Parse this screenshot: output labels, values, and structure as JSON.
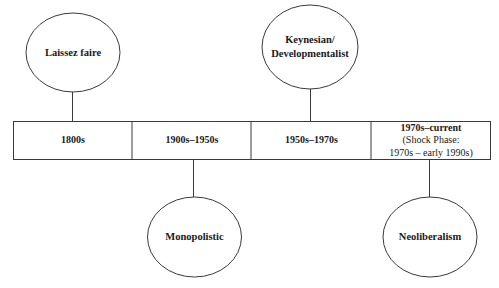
{
  "diagram": {
    "type": "timeline",
    "periods": [
      {
        "label": "1800s",
        "sublabel_line1": "",
        "sublabel_line2": ""
      },
      {
        "label": "1900s–1950s",
        "sublabel_line1": "",
        "sublabel_line2": ""
      },
      {
        "label": "1950s–1970s",
        "sublabel_line1": "",
        "sublabel_line2": ""
      },
      {
        "label": "1970s–current",
        "sublabel_line1": "(Shock Phase:",
        "sublabel_line2": "1970s – early 1990s)"
      }
    ],
    "phases": [
      {
        "label": "Laissez faire",
        "position": "above",
        "period_index": 0
      },
      {
        "label": "Monopolistic",
        "position": "below",
        "period_index": 1
      },
      {
        "label": "Keynesian/\nDevelopmentalist",
        "position": "above",
        "period_index": 2
      },
      {
        "label": "Neoliberalism",
        "position": "below",
        "period_index": 3
      }
    ],
    "colors": {
      "stroke": "#3a3a3a",
      "text": "#1a1a1a",
      "background": "#ffffff"
    }
  }
}
